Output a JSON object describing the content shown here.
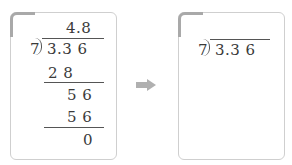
{
  "left_panel": {
    "quotient": "4.8",
    "divisor": "7",
    "dividend": "3.3 6",
    "step1_product": "2 8",
    "step1_remainder": "5 6",
    "step2_product": "5 6",
    "final_remainder": "0"
  },
  "arrow": {
    "icon": "right-arrow-icon",
    "color": "#b0b0b0"
  },
  "right_panel": {
    "divisor": "7",
    "dividend": "3.3 6"
  }
}
